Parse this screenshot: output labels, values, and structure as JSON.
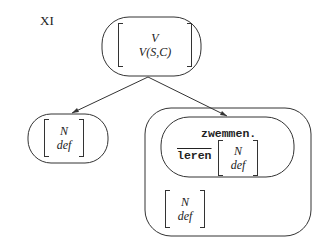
{
  "example_label": "XI",
  "tree": {
    "root": {
      "lines": [
        "V",
        "V(S,C)"
      ]
    },
    "left_child": {
      "lines": [
        "N",
        "def"
      ]
    },
    "right_child": {
      "inner": {
        "word": "zwemmen.",
        "verb": "leren",
        "matrix": [
          "N",
          "def"
        ]
      },
      "outer_matrix": [
        "N",
        "def"
      ]
    }
  }
}
